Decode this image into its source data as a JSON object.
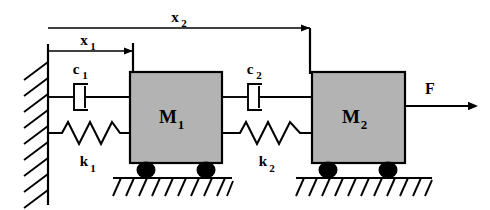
{
  "diagram": {
    "labels": {
      "x1": "x",
      "x1_sub": "1",
      "x2": "x",
      "x2_sub": "2",
      "c1": "c",
      "c1_sub": "1",
      "c2": "c",
      "c2_sub": "2",
      "k1": "k",
      "k1_sub": "1",
      "k2": "k",
      "k2_sub": "2",
      "m1": "M",
      "m1_sub": "1",
      "m2": "M",
      "m2_sub": "2",
      "force": "F"
    },
    "colors": {
      "stroke": "#000000",
      "mass_fill": "#b3b3b3",
      "background": "#ffffff",
      "wheel_fill": "#000000"
    },
    "components": [
      {
        "name": "wall",
        "type": "fixed-support"
      },
      {
        "name": "damper-c1",
        "type": "damper",
        "label": "c1"
      },
      {
        "name": "spring-k1",
        "type": "spring",
        "label": "k1"
      },
      {
        "name": "mass-m1",
        "type": "mass",
        "label": "M1"
      },
      {
        "name": "damper-c2",
        "type": "damper",
        "label": "c2"
      },
      {
        "name": "spring-k2",
        "type": "spring",
        "label": "k2"
      },
      {
        "name": "mass-m2",
        "type": "mass",
        "label": "M2"
      },
      {
        "name": "force-arrow",
        "type": "force",
        "label": "F"
      },
      {
        "name": "displacement-x1",
        "type": "dimension",
        "label": "x1"
      },
      {
        "name": "displacement-x2",
        "type": "dimension",
        "label": "x2"
      }
    ]
  }
}
